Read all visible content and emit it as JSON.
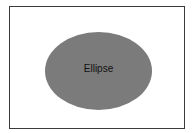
{
  "diagram": {
    "frame": {
      "border_color": "#3a3a3a",
      "background": "#ffffff"
    },
    "shapes": [
      {
        "type": "ellipse",
        "label": "Ellipse",
        "fill": "#7b7b7b",
        "text_color": "#111111"
      }
    ]
  }
}
